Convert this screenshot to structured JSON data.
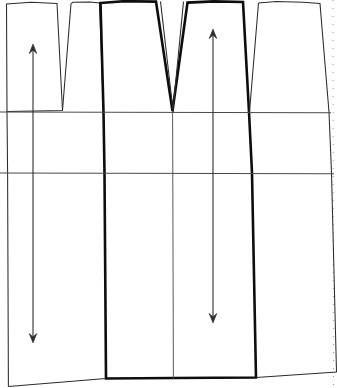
{
  "document": {
    "title": "Skirt Pattern Draft",
    "canvas_width": 337,
    "canvas_height": 388,
    "background_color": "#ffffff",
    "line_color_thin": "#2b2b2b",
    "line_color_bold": "#0d0d0d",
    "line_color_guide": "#4a4a4a",
    "line_color_dashed": "#9a9a9a"
  },
  "drawing": {
    "type": "sewing-pattern-draft",
    "description": "Flat pattern draft showing skirt panels with waist darts, two horizontal level guide lines, two grainline arrows and a heavier weight highlighted centre panel.",
    "pieces": [
      {
        "name": "left-panel",
        "weight": "thin",
        "outline": "M 6.5,4 L 31,2.5 L 57,3.5 L 73,105 L 62,110.5 L 7,111.5 Z"
      },
      {
        "name": "left-outer-edge",
        "weight": "thin",
        "outline": "M 7,111.5 L 7.5,173 L 8,386"
      },
      {
        "name": "second-panel",
        "weight": "thin",
        "outline": "M 71,4 L 90,2.5 L 101,3 L 104,112"
      },
      {
        "name": "centre-panel-bold",
        "weight": "bold",
        "outline": "M 101,3 L 156,1.5 L 172,110 L 188,3 L 243,2 L 249,112 L 252,173 L 256,377 L 106,378 L 104,173 Z"
      },
      {
        "name": "centre-dart-inner",
        "weight": "thin",
        "outline": "M 160,1 L 173,112 L 184,1"
      },
      {
        "name": "centre-vertical-line",
        "weight": "thin",
        "outline": "M 172,112 L 173,378"
      },
      {
        "name": "right-panel",
        "weight": "thin",
        "outline": "M 243,2 L 258,3 L 303,2.5 L 320,3.5 L 329,112 L 332,173 L 336,372"
      },
      {
        "name": "right-dart-leg",
        "weight": "thin",
        "outline": "M 258,3 L 249,112"
      },
      {
        "name": "lower-hem-line",
        "weight": "thin",
        "outline": "M 8,386 L 106,378 L 256,377 L 336,372"
      }
    ],
    "darts": [
      {
        "name": "dart-left",
        "apex_x": 62,
        "apex_y": 110,
        "waist_left_x": 57,
        "waist_right_x": 71,
        "depth_px": 108
      },
      {
        "name": "dart-second",
        "apex_x": 103,
        "apex_y": 112,
        "waist_left_x": 101,
        "waist_right_x": 101,
        "depth_px": 110
      },
      {
        "name": "dart-centre",
        "apex_x": 172,
        "apex_y": 111,
        "waist_left_x": 156,
        "waist_right_x": 188,
        "depth_px": 110
      },
      {
        "name": "dart-right",
        "apex_x": 249,
        "apex_y": 112,
        "waist_left_x": 243,
        "waist_right_x": 258,
        "depth_px": 110
      }
    ],
    "guide_lines": [
      {
        "name": "hip-line",
        "y": 112,
        "x_start": 0,
        "x_end": 331
      },
      {
        "name": "lower-level-line",
        "y": 173,
        "x_start": 0,
        "x_end": 334
      }
    ],
    "dashed_guides": [
      {
        "name": "right-margin-dashed",
        "x": 333,
        "y_start": 0,
        "y_end": 388
      }
    ],
    "grainlines": [
      {
        "name": "grainline-left",
        "x": 33,
        "y_top": 44,
        "y_bottom": 343,
        "length_px": 299,
        "arrow_heads": "both"
      },
      {
        "name": "grainline-centre",
        "x": 213,
        "y_top": 29,
        "y_bottom": 323,
        "length_px": 294,
        "arrow_heads": "both"
      }
    ]
  },
  "labels": {
    "visible_text": []
  }
}
